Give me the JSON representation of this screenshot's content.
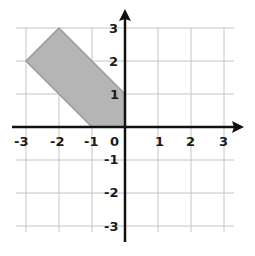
{
  "diagram": {
    "type": "coordinate-grid",
    "x_range": [
      -3,
      3
    ],
    "y_range": [
      -3,
      3
    ],
    "x_ticks": [
      "-3",
      "-2",
      "-1",
      "0",
      "1",
      "2",
      "3"
    ],
    "y_ticks": [
      "3",
      "2",
      "1",
      "-1",
      "-2",
      "-3"
    ],
    "shape": {
      "name": "shaded-pentagon",
      "vertices": [
        [
          -3,
          2
        ],
        [
          -2,
          3
        ],
        [
          0,
          1
        ],
        [
          0,
          0
        ],
        [
          -1,
          0
        ]
      ],
      "fill": "#b3b3b3",
      "stroke": "#9a9a9a"
    },
    "colors": {
      "grid": "#bdbdbd",
      "axis": "#111111"
    }
  },
  "labels": {
    "x": {
      "m3": "-3",
      "m2": "-2",
      "m1": "-1",
      "zero": "0",
      "p1": "1",
      "p2": "2",
      "p3": "3"
    },
    "y": {
      "p3": "3",
      "p2": "2",
      "p1": "1",
      "m1": "-1",
      "m2": "-2",
      "m3": "-3"
    }
  }
}
